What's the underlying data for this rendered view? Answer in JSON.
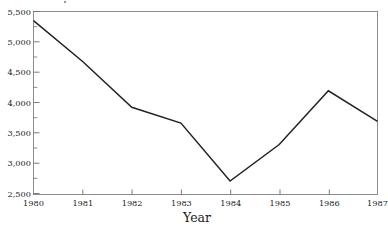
{
  "chart_data": {
    "type": "line",
    "title": "",
    "subtitle": "",
    "xlabel": "Year",
    "ylabel": "",
    "x": [
      1980,
      1981,
      1982,
      1983,
      1984,
      1985,
      1986,
      1987
    ],
    "categories": [
      "1980",
      "1981",
      "1982",
      "1983",
      "1984",
      "1985",
      "1986",
      "1987"
    ],
    "values": [
      5350,
      4680,
      3930,
      3670,
      2720,
      3320,
      4200,
      3700
    ],
    "series": [
      {
        "name": "",
        "values": [
          5350,
          4680,
          3930,
          3670,
          2720,
          3320,
          4200,
          3700
        ]
      }
    ],
    "xlim": [
      1980,
      1987
    ],
    "ylim": [
      2500,
      5500
    ],
    "ytick_values": [
      2500,
      3000,
      3500,
      4000,
      4500,
      5000,
      5500
    ],
    "ytick_labels": [
      "2,500",
      "3,000",
      "3,500",
      "4,000",
      "4,500",
      "5,000",
      "5,500"
    ],
    "ytick_minor_values": [
      2750,
      3250,
      3750,
      4250,
      4750,
      5250
    ],
    "xtick_values": [
      1980,
      1981,
      1982,
      1983,
      1984,
      1985,
      1986,
      1987
    ],
    "xtick_labels": [
      "1980",
      "1981",
      "1982",
      "1983",
      "1984",
      "1985",
      "1986",
      "1987"
    ],
    "grid": false,
    "legend": false,
    "legend_position": "none",
    "line_color": "#232323",
    "border_color": "#8c8c8c",
    "background_color": "#ffffff",
    "annotations": []
  },
  "axis": {
    "x_title": "Year"
  }
}
